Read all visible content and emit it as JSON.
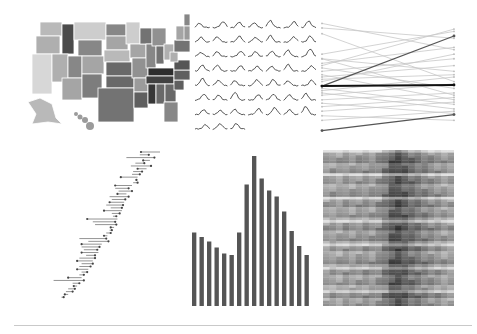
{
  "colors": {
    "background": "#ffffff",
    "ink": "#555555",
    "ink_dark": "#222222",
    "ink_light": "#c8c8c8",
    "rule": "#c9c9c9"
  },
  "chart_data": [
    {
      "id": "choropleth",
      "type": "heatmap",
      "title": "",
      "description": "US states choropleth map in grayscale; darkest in the South-East (Kentucky, Tennessee, Mississippi), light in the West and North",
      "states": [
        {
          "name": "WA",
          "shade": 0.25
        },
        {
          "name": "OR",
          "shade": 0.3
        },
        {
          "name": "CA",
          "shade": 0.1
        },
        {
          "name": "ID",
          "shade": 0.8
        },
        {
          "name": "NV",
          "shade": 0.3
        },
        {
          "name": "MT",
          "shade": 0.15
        },
        {
          "name": "WY",
          "shade": 0.5
        },
        {
          "name": "UT",
          "shade": 0.5
        },
        {
          "name": "AZ",
          "shade": 0.35
        },
        {
          "name": "CO",
          "shade": 0.35
        },
        {
          "name": "NM",
          "shade": 0.55
        },
        {
          "name": "ND",
          "shade": 0.5
        },
        {
          "name": "SD",
          "shade": 0.35
        },
        {
          "name": "NE",
          "shade": 0.25
        },
        {
          "name": "KS",
          "shade": 0.65
        },
        {
          "name": "OK",
          "shade": 0.65
        },
        {
          "name": "TX",
          "shade": 0.6
        },
        {
          "name": "MN",
          "shade": 0.15
        },
        {
          "name": "IA",
          "shade": 0.35
        },
        {
          "name": "MO",
          "shade": 0.45
        },
        {
          "name": "AR",
          "shade": 0.4
        },
        {
          "name": "LA",
          "shade": 0.7
        },
        {
          "name": "WI",
          "shade": 0.6
        },
        {
          "name": "IL",
          "shade": 0.5
        },
        {
          "name": "MI",
          "shade": 0.45
        },
        {
          "name": "IN",
          "shade": 0.6
        },
        {
          "name": "OH",
          "shade": 0.3
        },
        {
          "name": "KY",
          "shade": 0.95
        },
        {
          "name": "TN",
          "shade": 0.85
        },
        {
          "name": "MS",
          "shade": 0.9
        },
        {
          "name": "AL",
          "shade": 0.65
        },
        {
          "name": "GA",
          "shade": 0.65
        },
        {
          "name": "FL",
          "shade": 0.5
        },
        {
          "name": "SC",
          "shade": 0.7
        },
        {
          "name": "NC",
          "shade": 0.7
        },
        {
          "name": "VA",
          "shade": 0.75
        },
        {
          "name": "WV",
          "shade": 0.3
        },
        {
          "name": "PA",
          "shade": 0.6
        },
        {
          "name": "NY",
          "shade": 0.35
        },
        {
          "name": "ME",
          "shade": 0.5
        },
        {
          "name": "NE-states",
          "shade": 0.4
        },
        {
          "name": "AK",
          "shade": 0.25
        },
        {
          "name": "HI",
          "shade": 0.4
        }
      ]
    },
    {
      "id": "sparklines",
      "type": "line",
      "title": "",
      "grid": {
        "columns": 7,
        "rows": 8,
        "count": 52
      },
      "description": "Small-multiple sparklines, each a short series with a peak",
      "series_peaks": [
        0.2,
        0.5,
        0.4,
        0.3,
        0.7,
        0.5,
        0.6,
        0.3,
        0.4,
        0.5,
        0.3,
        0.6,
        0.4,
        0.5,
        0.2,
        0.3,
        0.4,
        0.3,
        0.4,
        0.6,
        0.8,
        0.5,
        0.5,
        0.4,
        0.3,
        0.3,
        0.6,
        0.4,
        0.7,
        0.4,
        0.3,
        0.5,
        0.5,
        0.3,
        0.4,
        0.5,
        0.3,
        0.8,
        0.4,
        0.5,
        0.4,
        0.6,
        0.3,
        0.2,
        0.4,
        0.5,
        0.7,
        0.3,
        0.9,
        0.2,
        0.4,
        0.4
      ]
    },
    {
      "id": "slopegraph",
      "type": "line",
      "title": "",
      "x": [
        "start",
        "end"
      ],
      "ylim": [
        0,
        100
      ],
      "highlight": [
        {
          "name": "rising",
          "values": [
            42,
            86
          ],
          "tone": "dark"
        },
        {
          "name": "flat",
          "values": [
            42,
            43
          ],
          "tone": "darkest"
        },
        {
          "name": "bottom-rising",
          "values": [
            3,
            17
          ],
          "tone": "dark"
        }
      ],
      "series": [
        {
          "values": [
            97,
            74
          ]
        },
        {
          "values": [
            93,
            84
          ]
        },
        {
          "values": [
            88,
            46
          ]
        },
        {
          "values": [
            70,
            90
          ]
        },
        {
          "values": [
            66,
            55
          ]
        },
        {
          "values": [
            62,
            76
          ]
        },
        {
          "values": [
            58,
            40
          ]
        },
        {
          "values": [
            55,
            66
          ]
        },
        {
          "values": [
            52,
            30
          ]
        },
        {
          "values": [
            50,
            60
          ]
        },
        {
          "values": [
            48,
            52
          ]
        },
        {
          "values": [
            46,
            70
          ]
        },
        {
          "values": [
            40,
            26
          ]
        },
        {
          "values": [
            38,
            50
          ]
        },
        {
          "values": [
            36,
            22
          ]
        },
        {
          "values": [
            34,
            44
          ]
        },
        {
          "values": [
            30,
            36
          ]
        },
        {
          "values": [
            27,
            18
          ]
        },
        {
          "values": [
            24,
            32
          ]
        },
        {
          "values": [
            20,
            28
          ]
        },
        {
          "values": [
            16,
            12
          ]
        },
        {
          "values": [
            12,
            20
          ]
        },
        {
          "values": [
            66,
            34
          ]
        },
        {
          "values": [
            60,
            92
          ]
        }
      ]
    },
    {
      "id": "range-dotplot",
      "type": "scatter",
      "title": "",
      "description": "Sorted range plot: each row a horizontal line with an end-dot, overall increasing trend from bottom-left to top-right",
      "rows": [
        [
          83,
          100
        ],
        [
          82,
          90
        ],
        [
          70,
          95
        ],
        [
          85,
          91
        ],
        [
          78,
          86
        ],
        [
          74,
          92
        ],
        [
          80,
          88
        ],
        [
          76,
          84
        ],
        [
          75,
          82
        ],
        [
          65,
          80
        ],
        [
          78,
          79
        ],
        [
          76,
          80
        ],
        [
          60,
          75
        ],
        [
          60,
          72
        ],
        [
          63,
          75
        ],
        [
          62,
          70
        ],
        [
          55,
          72
        ],
        [
          57,
          69
        ],
        [
          55,
          68
        ],
        [
          52,
          67
        ],
        [
          56,
          66
        ],
        [
          50,
          66
        ],
        [
          57,
          64
        ],
        [
          58,
          61
        ],
        [
          35,
          62
        ],
        [
          40,
          60
        ],
        [
          42,
          61
        ],
        [
          56,
          59
        ],
        [
          55,
          57
        ],
        [
          52,
          56
        ],
        [
          50,
          53
        ],
        [
          28,
          52
        ],
        [
          36,
          54
        ],
        [
          30,
          48
        ],
        [
          30,
          46
        ],
        [
          32,
          44
        ],
        [
          30,
          45
        ],
        [
          34,
          42
        ],
        [
          28,
          42
        ],
        [
          26,
          40
        ],
        [
          30,
          40
        ],
        [
          28,
          38
        ],
        [
          26,
          36
        ],
        [
          30,
          35
        ],
        [
          28,
          32
        ],
        [
          18,
          30
        ],
        [
          5,
          32
        ],
        [
          22,
          28
        ],
        [
          23,
          26
        ],
        [
          18,
          24
        ],
        [
          16,
          22
        ],
        [
          15,
          18
        ],
        [
          12,
          14
        ]
      ]
    },
    {
      "id": "bar",
      "type": "bar",
      "title": "",
      "xlabel": "",
      "ylabel": "",
      "categories": [
        "1",
        "2",
        "3",
        "4",
        "5",
        "6",
        "7",
        "8",
        "9",
        "10",
        "11",
        "12",
        "13",
        "14",
        "15",
        "16"
      ],
      "values": [
        49,
        46,
        43,
        39,
        35,
        34,
        49,
        81,
        100,
        85,
        77,
        73,
        63,
        50,
        40,
        34
      ],
      "ylim": [
        0,
        100
      ],
      "grid": false
    },
    {
      "id": "heatmap",
      "type": "heatmap",
      "title": "",
      "description": "Dense grayscale heatmap, ~20 columns x ~60 rows, darker band in the center columns",
      "columns": 20,
      "rows": 60,
      "column_darkness": [
        0.35,
        0.38,
        0.36,
        0.4,
        0.38,
        0.4,
        0.42,
        0.4,
        0.45,
        0.55,
        0.7,
        0.75,
        0.68,
        0.6,
        0.55,
        0.5,
        0.45,
        0.42,
        0.38,
        0.36
      ]
    }
  ]
}
